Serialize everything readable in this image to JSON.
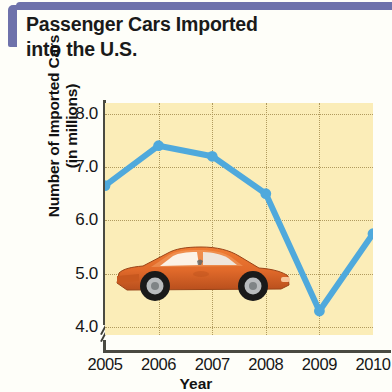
{
  "title": {
    "line1": "Passenger Cars Imported",
    "line2": "into the U.S."
  },
  "axis": {
    "y_title_line1": "Number of Imported Cars",
    "y_title_line2": "(in millions)",
    "x_title": "Year",
    "break_symbol": "axis-break"
  },
  "colors": {
    "plot_background": "#fbedb8",
    "line": "#4fa9dc",
    "marker": "#4fa9dc",
    "grid": "#b09a5e",
    "bracket": "#6e72ab",
    "axis": "#4a4a42",
    "car_body": "#e06a28"
  },
  "illustration": {
    "name": "orange-sports-car"
  },
  "chart_data": {
    "type": "line",
    "title": "Passenger Cars Imported into the U.S.",
    "xlabel": "Year",
    "ylabel": "Number of Imported Cars (in millions)",
    "categories": [
      "2005",
      "2006",
      "2007",
      "2008",
      "2009",
      "2010"
    ],
    "values": [
      6.65,
      7.4,
      7.2,
      6.5,
      4.3,
      5.75
    ],
    "x_tick_labels": [
      "2005",
      "2006",
      "2007",
      "2008",
      "2009",
      "2010"
    ],
    "y_tick_labels": [
      "8.0",
      "7.0",
      "6.0",
      "5.0",
      "4.0"
    ],
    "y_ticks": [
      8.0,
      7.0,
      6.0,
      5.0,
      4.0
    ],
    "ylim": [
      3.85,
      8.2
    ],
    "xlim": [
      "2005",
      "2010"
    ],
    "grid": true,
    "grid_style": "dotted",
    "legend": false,
    "y_axis_break": true,
    "markers": true
  }
}
